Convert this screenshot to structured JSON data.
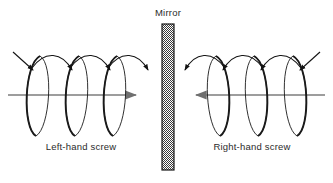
{
  "figure": {
    "title": "",
    "width": 333,
    "height": 183,
    "background_color": "#ffffff"
  },
  "mirror": {
    "label": "Mirror",
    "label_x": 168,
    "label_y": 16,
    "bar": {
      "x": 162,
      "y": 24,
      "width": 12,
      "height": 146,
      "border_color": "#1a1a1a",
      "fill_color": "#9a9a9a",
      "pattern": "stipple-checker"
    }
  },
  "axis_color": "#7d7d7d",
  "coil_color": "#1a1a1a",
  "helices": [
    {
      "name": "left-hand-screw",
      "label": "Left-hand screw",
      "label_x": 81,
      "label_y": 150,
      "handedness": "left",
      "axis": {
        "x_start": 8,
        "x_end": 140,
        "y": 95,
        "arrow_direction": "right"
      },
      "loops": [
        {
          "cx": 37,
          "cy": 96,
          "rx": 17,
          "ry": 40
        },
        {
          "cx": 76,
          "cy": 96,
          "rx": 17,
          "ry": 40
        },
        {
          "cx": 114,
          "cy": 96,
          "rx": 17,
          "ry": 40
        }
      ],
      "top_arrow_count": 4,
      "top_arrow_direction": "down-right",
      "thick_limb": "left"
    },
    {
      "name": "right-hand-screw",
      "label": "Right-hand screw",
      "label_x": 252,
      "label_y": 150,
      "handedness": "right",
      "axis": {
        "x_start": 325,
        "x_end": 192,
        "y": 95,
        "arrow_direction": "left"
      },
      "loops": [
        {
          "cx": 296,
          "cy": 96,
          "rx": 17,
          "ry": 40
        },
        {
          "cx": 257,
          "cy": 96,
          "rx": 17,
          "ry": 40
        },
        {
          "cx": 219,
          "cy": 96,
          "rx": 17,
          "ry": 40
        }
      ],
      "top_arrow_count": 4,
      "top_arrow_direction": "down-left",
      "thick_limb": "right"
    }
  ]
}
